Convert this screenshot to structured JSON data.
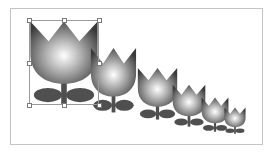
{
  "canvas": {
    "description": "Drawing canvas with a series of progressively smaller tulip shapes",
    "border_color": "#c4c4c4",
    "background": "#ffffff"
  },
  "colors": {
    "petal_highlight": "#ffffff",
    "petal_mid": "#9a9a9a",
    "petal_dark": "#3c3c3c",
    "stem_leaf": "#4f4f4f"
  },
  "tulips": [
    {
      "id": 1,
      "left": 29,
      "top": 20,
      "width": 70,
      "height": 85,
      "selected": true
    },
    {
      "id": 2,
      "left": 90,
      "top": 47,
      "width": 47,
      "height": 66,
      "selected": false
    },
    {
      "id": 3,
      "left": 137,
      "top": 67,
      "width": 41,
      "height": 53,
      "selected": false
    },
    {
      "id": 4,
      "left": 172,
      "top": 84,
      "width": 34,
      "height": 43,
      "selected": false
    },
    {
      "id": 5,
      "left": 201,
      "top": 97,
      "width": 28,
      "height": 35,
      "selected": false
    },
    {
      "id": 6,
      "left": 224,
      "top": 107,
      "width": 22,
      "height": 27,
      "selected": false
    }
  ],
  "selection": {
    "target": "tulip-1",
    "handles": [
      "top-left",
      "top-center",
      "top-right",
      "middle-left",
      "middle-right",
      "bottom-left",
      "bottom-center",
      "bottom-right"
    ]
  }
}
